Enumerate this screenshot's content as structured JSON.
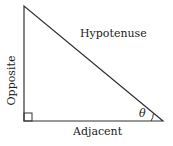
{
  "diagram": {
    "labels": {
      "hypotenuse": "Hypotenuse",
      "opposite": "Opposite",
      "adjacent": "Adjacent",
      "angle": "θ"
    },
    "vertices": {
      "top": [
        24,
        6
      ],
      "right_angle": [
        24,
        121
      ],
      "angle_vertex": [
        163,
        121
      ]
    },
    "line_color": "#333333"
  }
}
